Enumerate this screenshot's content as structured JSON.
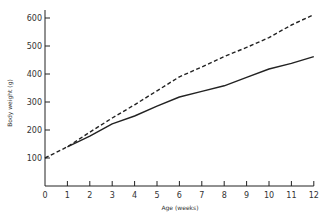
{
  "chart_data": {
    "type": "line",
    "title": "",
    "xlabel": "Age (weeks)",
    "ylabel": "Body weight (g)",
    "xlim": [
      0,
      12
    ],
    "ylim": [
      0,
      650
    ],
    "x_ticks": [
      0,
      1,
      2,
      3,
      4,
      5,
      6,
      7,
      8,
      9,
      10,
      11,
      12
    ],
    "y_ticks": [
      100,
      200,
      300,
      400,
      500,
      600
    ],
    "grid": false,
    "legend": null,
    "series": [
      {
        "name": "dashed",
        "style": "dashed",
        "color": "#222222",
        "x": [
          0,
          1,
          2,
          3,
          4,
          5,
          6,
          7,
          8,
          9,
          10,
          11,
          12
        ],
        "values": [
          100,
          140,
          192,
          243,
          290,
          340,
          390,
          425,
          462,
          495,
          530,
          575,
          612
        ]
      },
      {
        "name": "solid",
        "style": "solid",
        "color": "#222222",
        "x": [
          1,
          2,
          3,
          4,
          5,
          6,
          7,
          8,
          9,
          10,
          11,
          12
        ],
        "values": [
          140,
          178,
          222,
          250,
          285,
          318,
          338,
          358,
          388,
          418,
          438,
          462
        ]
      }
    ]
  }
}
